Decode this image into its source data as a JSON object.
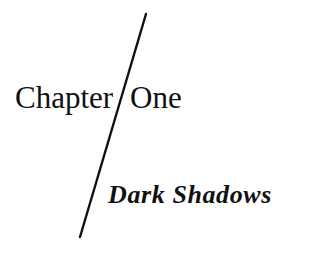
{
  "chapter": {
    "word": "Chapter",
    "number": "One",
    "title": "Dark Shadows"
  },
  "divider": {
    "color": "#111111",
    "x1": 146,
    "y1": 14,
    "x2": 80,
    "y2": 237
  }
}
